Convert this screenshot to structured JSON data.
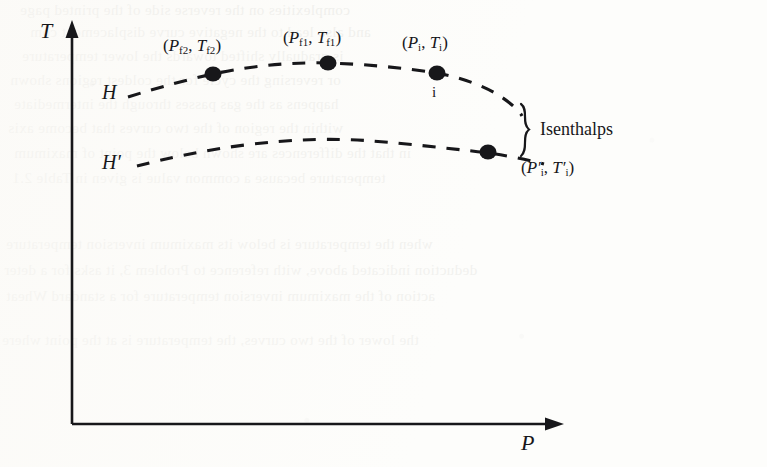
{
  "figure": {
    "type": "diagram",
    "axes": {
      "y": {
        "label": "T",
        "name": "temperature-axis",
        "arrow": "up"
      },
      "x": {
        "label": "P",
        "name": "pressure-axis",
        "arrow": "right"
      },
      "origin": {
        "x": 72,
        "y": 424
      }
    },
    "curves": [
      {
        "id": "upper-isenthalp",
        "label": "H",
        "style": "dashed",
        "points": [
          {
            "x": 128,
            "y": 97
          },
          {
            "x": 175,
            "y": 83
          },
          {
            "x": 213,
            "y": 74
          },
          {
            "x": 270,
            "y": 66
          },
          {
            "x": 328,
            "y": 63
          },
          {
            "x": 385,
            "y": 66
          },
          {
            "x": 437,
            "y": 73
          },
          {
            "x": 478,
            "y": 84
          },
          {
            "x": 508,
            "y": 101
          },
          {
            "x": 520,
            "y": 114
          }
        ]
      },
      {
        "id": "lower-isenthalp",
        "label": "H'",
        "style": "dashed",
        "points": [
          {
            "x": 137,
            "y": 166
          },
          {
            "x": 185,
            "y": 155
          },
          {
            "x": 240,
            "y": 146
          },
          {
            "x": 300,
            "y": 140
          },
          {
            "x": 360,
            "y": 140
          },
          {
            "x": 415,
            "y": 144
          },
          {
            "x": 460,
            "y": 149
          },
          {
            "x": 488,
            "y": 152
          },
          {
            "x": 520,
            "y": 158
          },
          {
            "x": 540,
            "y": 163
          }
        ]
      }
    ],
    "markers": [
      {
        "id": "pf2",
        "label": "(Pf2, Tf2)",
        "x": 213,
        "y": 74,
        "curve": "upper-isenthalp"
      },
      {
        "id": "pf1",
        "label": "(Pf1, Tf1)",
        "x": 328,
        "y": 63,
        "curve": "upper-isenthalp"
      },
      {
        "id": "pi",
        "label": "(Pi, Ti)",
        "x": 437,
        "y": 73,
        "curve": "upper-isenthalp",
        "sublabel": "i"
      },
      {
        "id": "pi-prime",
        "label": "(P'i, T'i)",
        "x": 488,
        "y": 152,
        "curve": "lower-isenthalp"
      }
    ],
    "annotation": {
      "brace": {
        "x": 525,
        "top": 104,
        "bottom": 157
      },
      "label": "Isenthalps"
    },
    "colors": {
      "ink": "#17171a",
      "paper": "#fdfdfb",
      "ghost_text": "#c9c9c4"
    }
  },
  "labels": {
    "y_axis": "T",
    "x_axis": "P",
    "curve_upper": "H",
    "curve_lower": "H′",
    "isenthalps": "Isenthalps",
    "point_i_small": "i"
  },
  "point_labels": {
    "pf2": {
      "p": "P",
      "p_sub": "f2",
      "t": "T",
      "t_sub": "f2"
    },
    "pf1": {
      "p": "P",
      "p_sub": "f1",
      "t": "T",
      "t_sub": "f1"
    },
    "pi": {
      "p": "P",
      "p_sub": "i",
      "t": "T",
      "t_sub": "i"
    },
    "pi_prime": {
      "p": "P′",
      "p_sub": "i",
      "t": "T′",
      "t_sub": "i"
    }
  },
  "background_text": {
    "note": "Faint mirrored show-through text from the reverse side of the printed page",
    "lines": [
      {
        "text": "complexities on the reverse side of the printed page",
        "x": 20,
        "y": 2,
        "size": 15,
        "opacity": 0.3
      },
      {
        "text": "and also lead to the negative curve displacement com",
        "x": 30,
        "y": 24,
        "size": 15,
        "opacity": 0.28
      },
      {
        "text": "is gradually shifted towards the lower temperature",
        "x": 22,
        "y": 48,
        "size": 15,
        "opacity": 0.26
      },
      {
        "text": "or reversing the cycle for the coldest regions shown",
        "x": 10,
        "y": 72,
        "size": 15,
        "opacity": 0.26
      },
      {
        "text": "happens as the gas passes through the intermediate",
        "x": 14,
        "y": 96,
        "size": 15,
        "opacity": 0.24
      },
      {
        "text": "within the region of the two curves that become axis",
        "x": 8,
        "y": 120,
        "size": 15,
        "opacity": 0.24
      },
      {
        "text": "in that the differences are shown below the point of maximum",
        "x": 14,
        "y": 145,
        "size": 15,
        "opacity": 0.24
      },
      {
        "text": "temperature because a common value is given in Table 2.1",
        "x": 12,
        "y": 170,
        "size": 15,
        "opacity": 0.22
      },
      {
        "text": "when the temperature is below its maximum inversion temperature",
        "x": 6,
        "y": 236,
        "size": 15,
        "opacity": 0.22
      },
      {
        "text": "deduction indicated above, with reference to Problem 3, it asks for a deter",
        "x": 4,
        "y": 262,
        "size": 15,
        "opacity": 0.22
      },
      {
        "text": "action of the maximum inversion temperature for a standard Wheat",
        "x": 6,
        "y": 288,
        "size": 15,
        "opacity": 0.22
      },
      {
        "text": "the lower of the two curves, the temperature is at the point where",
        "x": 2,
        "y": 332,
        "size": 15,
        "opacity": 0.2
      }
    ]
  }
}
